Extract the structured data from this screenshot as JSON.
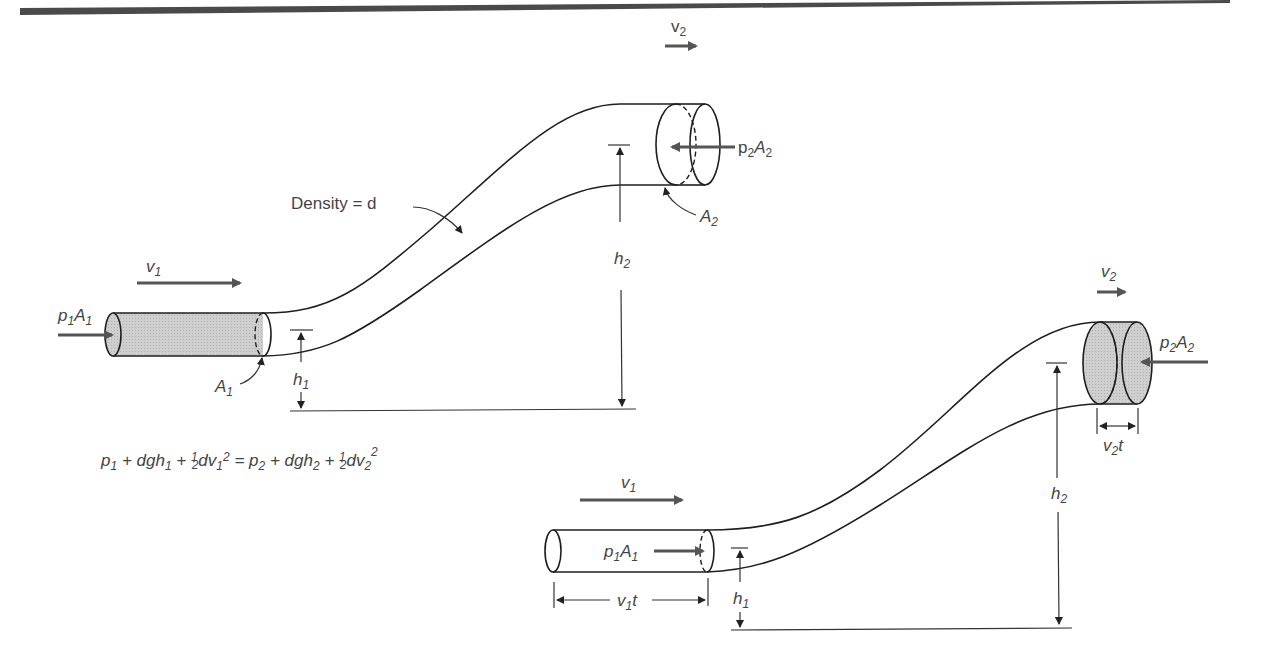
{
  "figure": {
    "header_bar_color": "#4a4a4a",
    "line_color": "#1e1e1e",
    "fill_color": "#c9c9c9",
    "arrow_color": "#555555"
  },
  "top_diagram": {
    "density_label": "Density = d",
    "v1": {
      "base": "v",
      "sub": "1"
    },
    "v2": {
      "base": "v",
      "sub": "2"
    },
    "p1A1": {
      "p": "p",
      "psub": "1",
      "A": "A",
      "Asub": "1"
    },
    "p2A2": {
      "p": "p",
      "psub": "2",
      "A": "A",
      "Asub": "2"
    },
    "A1": {
      "base": "A",
      "sub": "1"
    },
    "A2": {
      "base": "A",
      "sub": "2"
    },
    "h1": {
      "base": "h",
      "sub": "1"
    },
    "h2": {
      "base": "h",
      "sub": "2"
    }
  },
  "equation": {
    "parts": [
      "p",
      "1",
      " + dgh",
      "1",
      " + ",
      "1",
      "2",
      "dv",
      "1",
      "2",
      " = p",
      "2",
      " + dgh",
      "2",
      " + ",
      "1",
      "2",
      "dv",
      "2",
      "2"
    ]
  },
  "bottom_diagram": {
    "v1": {
      "base": "v",
      "sub": "1"
    },
    "v2": {
      "base": "v",
      "sub": "2"
    },
    "p1A1": {
      "p": "p",
      "psub": "1",
      "A": "A",
      "Asub": "1"
    },
    "p2A2": {
      "p": "p",
      "psub": "2",
      "A": "A",
      "Asub": "2"
    },
    "h1": {
      "base": "h",
      "sub": "1"
    },
    "h2": {
      "base": "h",
      "sub": "2"
    },
    "v1t": {
      "base": "v",
      "sub": "1",
      "suffix": "t"
    },
    "v2t": {
      "base": "v",
      "sub": "2",
      "suffix": "t"
    }
  }
}
